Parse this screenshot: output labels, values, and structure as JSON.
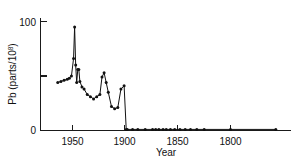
{
  "chart_data": {
    "type": "line",
    "title": "",
    "subtitle": "",
    "xlabel": "Year",
    "ylabel": "Pb (parts/10",
    "ylabel_sup": "8",
    "ylabel_suffix": ")",
    "ylabel_full": "Pb (parts/10⁸)",
    "xlim": [
      1965,
      1745
    ],
    "ylim": [
      0,
      108
    ],
    "x_reversed": true,
    "grid": false,
    "legend": null,
    "legend_position": "none",
    "x_ticks": [
      1950,
      1900,
      1850,
      1800
    ],
    "x_tick_labels": [
      "1950",
      "1900",
      "1850",
      "1800"
    ],
    "y_ticks": [
      0,
      50,
      100
    ],
    "y_tick_labels": [
      "0",
      "",
      "100"
    ],
    "y_minor_tick_unlabeled": 50,
    "marker": "circle",
    "series": [
      {
        "name": "Pb in Greenland ice",
        "x": [
          1964,
          1961,
          1958,
          1955,
          1953,
          1951,
          1949,
          1948,
          1947,
          1946,
          1945,
          1944,
          1943,
          1941,
          1939,
          1936,
          1933,
          1930,
          1927,
          1924,
          1922,
          1920,
          1918,
          1916,
          1913,
          1910,
          1907,
          1904,
          1901,
          1899
        ],
        "y": [
          44,
          45,
          46,
          47,
          48,
          50,
          66,
          95,
          60,
          44,
          56,
          56,
          45,
          40,
          38,
          33,
          31,
          29,
          31,
          33,
          49,
          53,
          44,
          35,
          22,
          20,
          21,
          38,
          41,
          1
        ],
        "connected": true
      },
      {
        "name": "Pre-1900 baseline",
        "x": [
          1898,
          1893,
          1888,
          1881,
          1874,
          1871,
          1868,
          1864,
          1861,
          1857,
          1853,
          1848,
          1843,
          1838,
          1832,
          1825,
          1800,
          1757
        ],
        "y": [
          1,
          1,
          1,
          1,
          1,
          1,
          1,
          1,
          1,
          1,
          1,
          1,
          1,
          1,
          1,
          1,
          1,
          1
        ],
        "connected": true
      }
    ],
    "colors": {
      "line": "#111111",
      "marker": "#111111",
      "axis": "#1a1a1a",
      "background": "#ffffff"
    }
  }
}
